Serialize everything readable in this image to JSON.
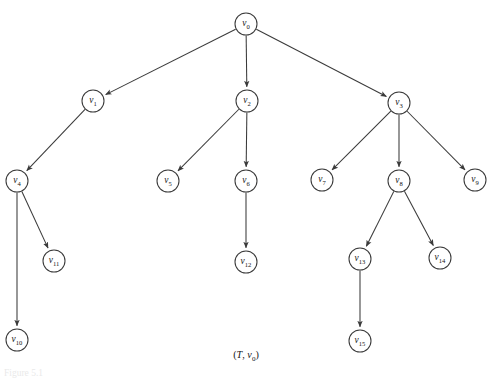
{
  "figure": {
    "caption_open": "(",
    "caption_graph": "T",
    "caption_comma": ", ",
    "caption_vertex": "v",
    "caption_vertex_sub": "0",
    "caption_close": ")",
    "footer": "Figure 5.1",
    "stroke_color": "#3a3a3a",
    "background_color": "#ffffff",
    "text_color": "#141414"
  },
  "graph": {
    "type": "rooted-tree",
    "root": "v0",
    "node_radius": 11,
    "nodes": [
      {
        "id": "v0",
        "base": "v",
        "sub": "0",
        "cx": 246,
        "cy": 24
      },
      {
        "id": "v1",
        "base": "v",
        "sub": "1",
        "cx": 93,
        "cy": 101
      },
      {
        "id": "v2",
        "base": "v",
        "sub": "2",
        "cx": 247,
        "cy": 101
      },
      {
        "id": "v3",
        "base": "v",
        "sub": "3",
        "cx": 399,
        "cy": 103
      },
      {
        "id": "v4",
        "base": "v",
        "sub": "4",
        "cx": 17,
        "cy": 181
      },
      {
        "id": "v5",
        "base": "v",
        "sub": "5",
        "cx": 168,
        "cy": 181
      },
      {
        "id": "v6",
        "base": "v",
        "sub": "6",
        "cx": 246,
        "cy": 181
      },
      {
        "id": "v7",
        "base": "v",
        "sub": "7",
        "cx": 322,
        "cy": 180
      },
      {
        "id": "v8",
        "base": "v",
        "sub": "8",
        "cx": 399,
        "cy": 181
      },
      {
        "id": "v9",
        "base": "v",
        "sub": "9",
        "cx": 475,
        "cy": 180
      },
      {
        "id": "v10",
        "base": "v",
        "sub": "10",
        "cx": 17,
        "cy": 340
      },
      {
        "id": "v11",
        "base": "v",
        "sub": "11",
        "cx": 54,
        "cy": 261
      },
      {
        "id": "v12",
        "base": "v",
        "sub": "12",
        "cx": 246,
        "cy": 262
      },
      {
        "id": "v13",
        "base": "v",
        "sub": "13",
        "cx": 360,
        "cy": 259
      },
      {
        "id": "v14",
        "base": "v",
        "sub": "14",
        "cx": 440,
        "cy": 258
      },
      {
        "id": "v15",
        "base": "v",
        "sub": "15",
        "cx": 360,
        "cy": 341
      }
    ],
    "edges": [
      {
        "from": "v0",
        "to": "v1"
      },
      {
        "from": "v0",
        "to": "v2"
      },
      {
        "from": "v0",
        "to": "v3"
      },
      {
        "from": "v1",
        "to": "v4"
      },
      {
        "from": "v2",
        "to": "v5"
      },
      {
        "from": "v2",
        "to": "v6"
      },
      {
        "from": "v3",
        "to": "v7"
      },
      {
        "from": "v3",
        "to": "v8"
      },
      {
        "from": "v3",
        "to": "v9"
      },
      {
        "from": "v4",
        "to": "v10"
      },
      {
        "from": "v4",
        "to": "v11"
      },
      {
        "from": "v6",
        "to": "v12"
      },
      {
        "from": "v8",
        "to": "v13"
      },
      {
        "from": "v8",
        "to": "v14"
      },
      {
        "from": "v13",
        "to": "v15"
      }
    ]
  }
}
